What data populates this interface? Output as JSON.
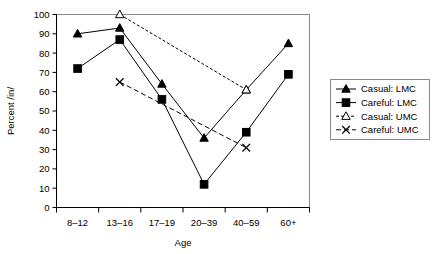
{
  "chart_data": {
    "type": "line",
    "title": "",
    "xlabel": "Age",
    "ylabel": "Percent /in/",
    "categories": [
      "8–12",
      "13–16",
      "17–19",
      "20–39",
      "40–59",
      "60+"
    ],
    "ylim": [
      0,
      100
    ],
    "yticks": [
      0,
      10,
      20,
      30,
      40,
      50,
      60,
      70,
      80,
      90,
      100
    ],
    "ytick_labels": [
      "0",
      "10",
      "20",
      "30",
      "40",
      "50",
      "60",
      "70",
      "80",
      "90",
      "100"
    ],
    "grid": false,
    "legend_position": "right",
    "series": [
      {
        "name": "Casual: LMC",
        "marker": "filled-triangle",
        "linestyle": "solid",
        "color": "#000000",
        "values": [
          90,
          93,
          64,
          36,
          61,
          85
        ]
      },
      {
        "name": "Careful: LMC",
        "marker": "filled-square",
        "linestyle": "solid",
        "color": "#000000",
        "values": [
          72,
          87,
          56,
          12,
          39,
          69
        ]
      },
      {
        "name": "Casual: UMC",
        "marker": "open-triangle",
        "linestyle": "dotted",
        "color": "#000000",
        "values": [
          null,
          100,
          null,
          null,
          61,
          null
        ]
      },
      {
        "name": "Careful: UMC",
        "marker": "cross-x",
        "linestyle": "dashed",
        "color": "#000000",
        "values": [
          null,
          65,
          null,
          null,
          31,
          null
        ]
      }
    ]
  },
  "axes": {
    "x_title": "Age",
    "y_title": "Percent /in/",
    "x_tick_labels": [
      "8–12",
      "13–16",
      "17–19",
      "20–39",
      "40–59",
      "60+"
    ],
    "y_tick_labels": [
      "100",
      "90",
      "80",
      "70",
      "60",
      "50",
      "40",
      "30",
      "20",
      "10",
      "0"
    ]
  },
  "legend": {
    "items": [
      {
        "label": "Casual: LMC",
        "marker": "filled-triangle",
        "linestyle": "solid"
      },
      {
        "label": "Careful: LMC",
        "marker": "filled-square",
        "linestyle": "solid"
      },
      {
        "label": "Casual: UMC",
        "marker": "open-triangle",
        "linestyle": "dotted"
      },
      {
        "label": "Careful: UMC",
        "marker": "cross-x",
        "linestyle": "dashed"
      }
    ]
  },
  "colors": {
    "ink": "#000000",
    "frame": "#8a8a8a",
    "background": "#ffffff"
  }
}
